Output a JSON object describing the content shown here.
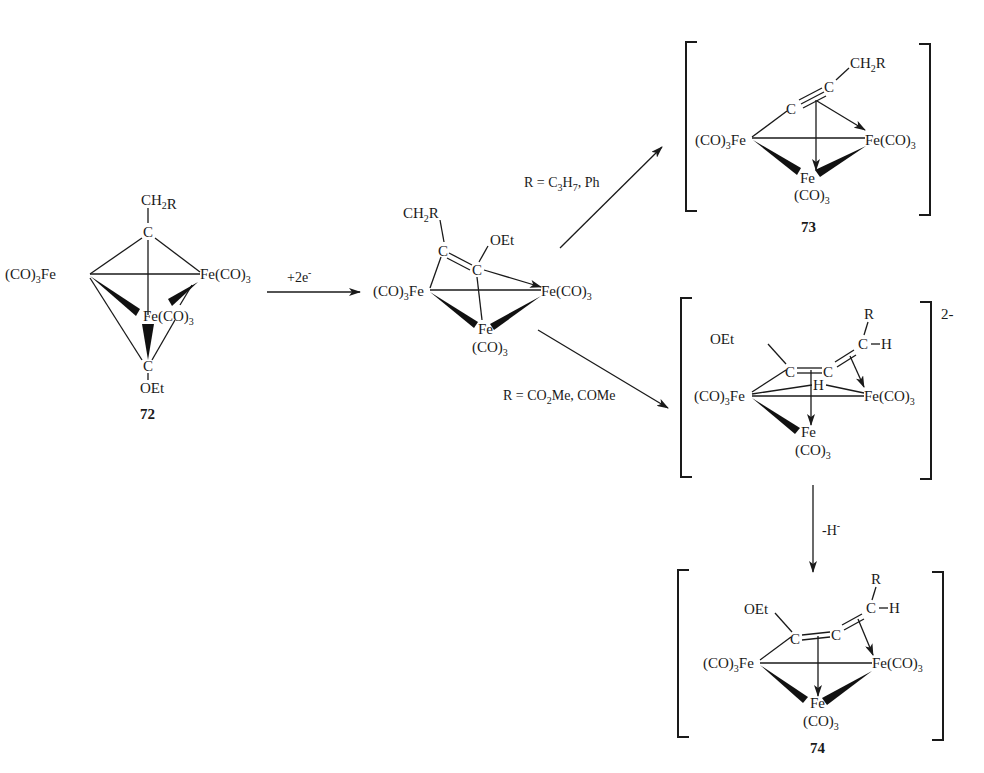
{
  "scheme": {
    "compounds": {
      "c72": {
        "id": "72",
        "top_substituent": "CH2R",
        "bottom_substituent": "OEt",
        "left_fe": "(CO)3Fe",
        "right_fe": "Fe(CO)3",
        "center_fe": "Fe(CO)3",
        "carbon": "C"
      },
      "intermediate": {
        "substituent_1": "CH2R",
        "substituent_2": "OEt",
        "left_fe": "(CO)3Fe",
        "right_fe": "Fe(CO)3",
        "bottom_fe": "Fe",
        "bottom_co": "(CO)3",
        "carbon": "C"
      },
      "c73": {
        "id": "73",
        "substituent": "CH2R",
        "left_fe": "(CO)3Fe",
        "right_fe": "Fe(CO)3",
        "bottom_fe": "Fe",
        "bottom_co": "(CO)3",
        "carbon": "C"
      },
      "dianion": {
        "charge": "2-",
        "substituent_oet": "OEt",
        "substituent_r": "R",
        "hydrogen": "H",
        "bridging_h": "H",
        "left_fe": "(CO)3Fe",
        "right_fe": "Fe(CO)3",
        "bottom_fe": "Fe",
        "bottom_co": "(CO)3",
        "carbon": "C"
      },
      "c74": {
        "id": "74",
        "substituent_oet": "OEt",
        "substituent_r": "R",
        "hydrogen": "H",
        "left_fe": "(CO)3Fe",
        "right_fe": "Fe(CO)3",
        "bottom_fe": "Fe",
        "bottom_co": "(CO)3",
        "carbon": "C"
      }
    },
    "arrows": {
      "reduction": {
        "label": "+2e",
        "label_sup": "-"
      },
      "to_73": {
        "label_pre": "R = C",
        "sub1": "3",
        "mid": "H",
        "sub2": "7",
        "post": ", Ph"
      },
      "to_dianion": {
        "label_pre": "R = CO",
        "sub1": "2",
        "post": "Me, COMe"
      },
      "hydride_loss": {
        "label": "-H",
        "label_sup": "-"
      }
    }
  }
}
